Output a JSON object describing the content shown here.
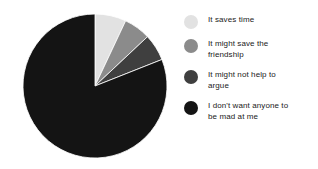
{
  "chart_data": {
    "type": "pie",
    "title": "",
    "subtitle": "",
    "xlabel": "",
    "ylabel": "",
    "legend_position": "right",
    "grid": false,
    "start_angle_deg": 0,
    "direction": "clockwise",
    "categories": [
      "It saves time",
      "It might save the\nfriendship",
      "It might not help to\nargue",
      "I don't want anyone to\nbe mad at me"
    ],
    "values": [
      7,
      6,
      6,
      81
    ],
    "colors": [
      "#e2e2e2",
      "#8b8b8b",
      "#3f3f3f",
      "#141414"
    ],
    "slices": [
      {
        "label": "It saves time",
        "value": 7,
        "color": "#e2e2e2"
      },
      {
        "label": "It might save the friendship",
        "value": 6,
        "color": "#8b8b8b"
      },
      {
        "label": "It might not help to argue",
        "value": 6,
        "color": "#3f3f3f"
      },
      {
        "label": "I don't want anyone to be mad at me",
        "value": 81,
        "color": "#141414"
      }
    ]
  },
  "legend": {
    "items": [
      {
        "label": "It saves time",
        "color": "#e2e2e2",
        "swatch_name": "legend-swatch-it-saves-time"
      },
      {
        "label": "It might save the\nfriendship",
        "color": "#8b8b8b",
        "swatch_name": "legend-swatch-might-save-friendship"
      },
      {
        "label": "It might not help to\nargue",
        "color": "#3f3f3f",
        "swatch_name": "legend-swatch-might-not-help-argue"
      },
      {
        "label": "I don't want anyone to\nbe mad at me",
        "color": "#141414",
        "swatch_name": "legend-swatch-dont-want-mad"
      }
    ]
  },
  "figure": {
    "background": "#ffffff"
  }
}
